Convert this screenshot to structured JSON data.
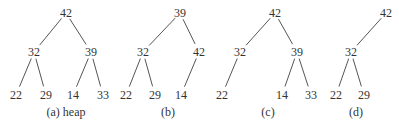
{
  "trees": [
    {
      "caption": "(a) heap",
      "nodes": [
        {
          "id": "a0",
          "label": "42",
          "x": 66,
          "y": 17
        },
        {
          "id": "a1",
          "label": "32",
          "x": 34,
          "y": 56
        },
        {
          "id": "a2",
          "label": "39",
          "x": 91,
          "y": 56
        },
        {
          "id": "a3",
          "label": "22",
          "x": 16,
          "y": 99
        },
        {
          "id": "a4",
          "label": "29",
          "x": 46,
          "y": 99
        },
        {
          "id": "a5",
          "label": "14",
          "x": 73,
          "y": 99
        },
        {
          "id": "a6",
          "label": "33",
          "x": 103,
          "y": 99
        }
      ],
      "edges": [
        [
          "a0",
          "a1"
        ],
        [
          "a0",
          "a2"
        ],
        [
          "a1",
          "a3"
        ],
        [
          "a1",
          "a4"
        ],
        [
          "a2",
          "a5"
        ],
        [
          "a2",
          "a6"
        ]
      ],
      "caption_x": 66
    },
    {
      "caption": "(b)",
      "nodes": [
        {
          "id": "b0",
          "label": "39",
          "x": 180,
          "y": 17
        },
        {
          "id": "b1",
          "label": "32",
          "x": 143,
          "y": 56
        },
        {
          "id": "b2",
          "label": "42",
          "x": 199,
          "y": 56
        },
        {
          "id": "b3",
          "label": "22",
          "x": 126,
          "y": 99
        },
        {
          "id": "b4",
          "label": "29",
          "x": 155,
          "y": 99
        },
        {
          "id": "b5",
          "label": "14",
          "x": 181,
          "y": 99
        }
      ],
      "edges": [
        [
          "b0",
          "b1"
        ],
        [
          "b0",
          "b2"
        ],
        [
          "b1",
          "b3"
        ],
        [
          "b1",
          "b4"
        ],
        [
          "b2",
          "b5"
        ]
      ],
      "caption_x": 168
    },
    {
      "caption": "(c)",
      "nodes": [
        {
          "id": "c0",
          "label": "42",
          "x": 275,
          "y": 17
        },
        {
          "id": "c1",
          "label": "32",
          "x": 240,
          "y": 56
        },
        {
          "id": "c2",
          "label": "39",
          "x": 297,
          "y": 56
        },
        {
          "id": "c3",
          "label": "22",
          "x": 222,
          "y": 99
        },
        {
          "id": "c5",
          "label": "14",
          "x": 282,
          "y": 99
        },
        {
          "id": "c6",
          "label": "33",
          "x": 311,
          "y": 99
        }
      ],
      "edges": [
        [
          "c0",
          "c1"
        ],
        [
          "c0",
          "c2"
        ],
        [
          "c1",
          "c3"
        ],
        [
          "c2",
          "c5"
        ],
        [
          "c2",
          "c6"
        ]
      ],
      "caption_x": 268
    },
    {
      "caption": "(d)",
      "nodes": [
        {
          "id": "d0",
          "label": "42",
          "x": 386,
          "y": 17
        },
        {
          "id": "d1",
          "label": "32",
          "x": 351,
          "y": 56
        },
        {
          "id": "d3",
          "label": "22",
          "x": 336,
          "y": 99
        },
        {
          "id": "d4",
          "label": "29",
          "x": 364,
          "y": 99
        }
      ],
      "edges": [
        [
          "d0",
          "d1"
        ],
        [
          "d1",
          "d3"
        ],
        [
          "d1",
          "d4"
        ]
      ],
      "caption_x": 356
    }
  ],
  "caption_y": 116
}
